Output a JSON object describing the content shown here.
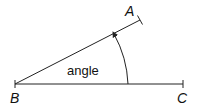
{
  "diagram": {
    "type": "angle",
    "points": {
      "A": {
        "label": "A",
        "x": 140,
        "y": 20
      },
      "B": {
        "label": "B",
        "x": 15,
        "y": 84
      },
      "C": {
        "label": "C",
        "x": 183,
        "y": 84
      }
    },
    "angle_label": "angle",
    "stroke_color": "#222222"
  }
}
